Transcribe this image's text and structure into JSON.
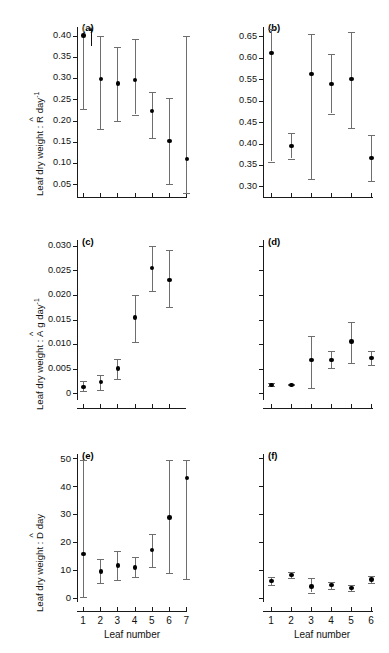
{
  "figure": {
    "panels": [
      "a",
      "b",
      "c",
      "d",
      "e",
      "f"
    ],
    "xlabel": "Leaf number",
    "marker_color": "#000000",
    "errorbar_color": "#6e6e6e",
    "axis_color": "#1a1a1a"
  },
  "labels": {
    "row1_ylabel_prefix": "Leaf dry weight : ",
    "row1_ylabel_symbol": "R",
    "row1_ylabel_suffix": " day",
    "row1_ylabel_exp": "-1",
    "row2_ylabel_prefix": "Leaf dry weight : ",
    "row2_ylabel_symbol": "A",
    "row2_ylabel_suffix": " g day",
    "row2_ylabel_exp": "-1",
    "row3_ylabel_prefix": "Leaf dry weight : ",
    "row3_ylabel_symbol": "D",
    "row3_ylabel_suffix": " day",
    "row3_ylabel_exp": "",
    "tag_a": "(a)",
    "tag_b": "(b)",
    "tag_c": "(c)",
    "tag_d": "(d)",
    "tag_e": "(e)",
    "tag_f": "(f)",
    "xtitle_left": "Leaf number",
    "xtitle_right": "Leaf number"
  },
  "chart_data": [
    {
      "panel": "a",
      "type": "scatter",
      "title": "(a)",
      "xlabel": "",
      "ylabel": "Leaf dry weight : R day-1",
      "x": [
        1,
        2,
        3,
        4,
        5,
        6,
        7
      ],
      "xticklabels": [
        "",
        "",
        "",
        "",
        "",
        "",
        ""
      ],
      "values": [
        0.4,
        0.298,
        0.287,
        0.296,
        0.223,
        0.152,
        0.11
      ],
      "err_low": [
        0.227,
        0.179,
        0.199,
        0.214,
        0.158,
        0.05,
        0.03
      ],
      "err_high": [
        0.44,
        0.4,
        0.373,
        0.392,
        0.266,
        0.253,
        0.4
      ],
      "ylim": [
        0.02,
        0.42
      ],
      "yticks": [
        0.05,
        0.1,
        0.15,
        0.2,
        0.25,
        0.3,
        0.35,
        0.4
      ],
      "yticklabels": [
        "0.05",
        "0.10",
        "0.15",
        "0.20",
        "0.25",
        "0.30",
        "0.35",
        "0.40"
      ],
      "annotation": "up-arrow above point 2 (error bar exceeds axis)",
      "grid": false,
      "legend": "none"
    },
    {
      "panel": "b",
      "type": "scatter",
      "title": "(b)",
      "xlabel": "",
      "ylabel": "Leaf dry weight : R day-1",
      "x": [
        1,
        2,
        3,
        4,
        5,
        6
      ],
      "xticklabels": [
        "",
        "",
        "",
        "",
        "",
        ""
      ],
      "values": [
        0.611,
        0.394,
        0.563,
        0.539,
        0.551,
        0.366
      ],
      "err_low": [
        0.358,
        0.365,
        0.316,
        0.47,
        0.437,
        0.312
      ],
      "err_high": [
        0.668,
        0.424,
        0.655,
        0.608,
        0.66,
        0.419
      ],
      "ylim": [
        0.275,
        0.672
      ],
      "yticks": [
        0.3,
        0.35,
        0.4,
        0.45,
        0.5,
        0.55,
        0.6,
        0.65
      ],
      "yticklabels": [
        "0.30",
        "0.35",
        "0.40",
        "0.45",
        "0.50",
        "0.55",
        "0.60",
        "0.65"
      ],
      "grid": false,
      "legend": "none"
    },
    {
      "panel": "c",
      "type": "scatter",
      "title": "(c)",
      "xlabel": "",
      "ylabel": "Leaf dry weight : A g day-1",
      "x": [
        1,
        2,
        3,
        4,
        5,
        6
      ],
      "xticklabels": [
        "",
        "",
        "",
        "",
        "",
        ""
      ],
      "values": [
        0.0013,
        0.0022,
        0.005,
        0.0154,
        0.0255,
        0.0231
      ],
      "err_low": [
        0.0004,
        0.0006,
        0.0028,
        0.0105,
        0.0209,
        0.0175
      ],
      "err_high": [
        0.0025,
        0.0038,
        0.0069,
        0.0201,
        0.03,
        0.0291
      ],
      "ylim": [
        -0.0014,
        0.0312
      ],
      "yticks": [
        0,
        0.005,
        0.01,
        0.015,
        0.02,
        0.025,
        0.03
      ],
      "yticklabels": [
        "0",
        "0.005",
        "0.010",
        "0.015",
        "0.020",
        "0.025",
        "0.030"
      ],
      "grid": false,
      "legend": "none"
    },
    {
      "panel": "d",
      "type": "scatter",
      "title": "(d)",
      "xlabel": "",
      "ylabel": "Leaf dry weight : A g day-1",
      "x": [
        1,
        2,
        3,
        4,
        5,
        6
      ],
      "xticklabels": [
        "",
        "",
        "",
        "",
        "",
        ""
      ],
      "values": [
        0.0017,
        0.0017,
        0.0068,
        0.0068,
        0.0105,
        0.0071
      ],
      "err_low": [
        0.0014,
        0.0016,
        0.001,
        0.0051,
        0.0062,
        0.0057
      ],
      "err_high": [
        0.002,
        0.0019,
        0.0117,
        0.0085,
        0.0145,
        0.0085
      ],
      "ylim": [
        -0.0014,
        0.0312
      ],
      "yticks": [
        0,
        0.005,
        0.01,
        0.015,
        0.02,
        0.025,
        0.03
      ],
      "yticklabels": [
        "",
        "",
        "",
        "",
        "",
        "",
        ""
      ],
      "grid": false,
      "legend": "none"
    },
    {
      "panel": "e",
      "type": "scatter",
      "title": "(e)",
      "xlabel": "Leaf number",
      "ylabel": "Leaf dry weight : D day",
      "x": [
        1,
        2,
        3,
        4,
        5,
        6,
        7
      ],
      "xticklabels": [
        "1",
        "2",
        "3",
        "4",
        "5",
        "6",
        "7"
      ],
      "values": [
        15.7,
        9.4,
        11.6,
        10.9,
        17.1,
        28.8,
        42.8
      ],
      "err_low": [
        0.3,
        5.2,
        6.5,
        7.3,
        11.2,
        8.9,
        6.6
      ],
      "err_high": [
        49.5,
        13.8,
        16.8,
        14.6,
        23.0,
        49.5,
        49.5
      ],
      "ylim": [
        -1.5,
        51.5
      ],
      "yticks": [
        0,
        10,
        20,
        30,
        40,
        50
      ],
      "yticklabels": [
        "0",
        "10",
        "20",
        "30",
        "40",
        "50"
      ],
      "grid": false,
      "legend": "none"
    },
    {
      "panel": "f",
      "type": "scatter",
      "title": "(f)",
      "xlabel": "Leaf number",
      "ylabel": "Leaf dry weight : D day",
      "x": [
        1,
        2,
        3,
        4,
        5,
        6
      ],
      "xticklabels": [
        "1",
        "2",
        "3",
        "4",
        "5",
        "6"
      ],
      "values": [
        6.1,
        8.1,
        4.1,
        4.6,
        3.5,
        6.6
      ],
      "err_low": [
        4.5,
        7.2,
        1.9,
        3.3,
        2.4,
        5.3
      ],
      "err_high": [
        7.4,
        9.1,
        7.0,
        5.8,
        4.6,
        7.9
      ],
      "ylim": [
        -1.5,
        51.5
      ],
      "yticks": [
        0,
        10,
        20,
        30,
        40,
        50
      ],
      "yticklabels": [
        "",
        "",
        "",
        "",
        "",
        ""
      ],
      "grid": false,
      "legend": "none"
    }
  ]
}
